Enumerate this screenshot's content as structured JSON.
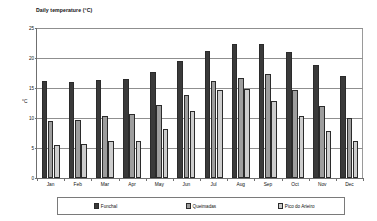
{
  "chart_data": {
    "type": "bar",
    "title": "Daily temperature  (°C)",
    "xlabel": "",
    "ylabel": "°C",
    "ylim": [
      0,
      25
    ],
    "yticks": [
      0,
      5,
      10,
      15,
      20,
      25
    ],
    "ytick_labels": [
      "0",
      "5",
      "10",
      "15",
      "20",
      "25"
    ],
    "grid": true,
    "legend_position": "bottom",
    "categories": [
      "Jan",
      "Feb",
      "Mar",
      "Apr",
      "May",
      "Jun",
      "Jul",
      "Aug",
      "Sep",
      "Oct",
      "Nov",
      "Dec"
    ],
    "series": [
      {
        "name": "Funchal",
        "color": "#3a3a3a",
        "values": [
          16.1,
          16.0,
          16.3,
          16.5,
          17.7,
          19.5,
          21.1,
          22.3,
          22.3,
          21.0,
          18.9,
          17.0
        ]
      },
      {
        "name": "Queimadas",
        "color": "#9d9d9d",
        "values": [
          9.5,
          9.6,
          10.4,
          10.6,
          12.2,
          13.9,
          16.1,
          16.6,
          17.3,
          14.6,
          12.0,
          10.0
        ]
      },
      {
        "name": "Pico do Arieiro",
        "color": "#cdcdcd",
        "values": [
          5.5,
          5.6,
          6.2,
          6.1,
          8.2,
          11.1,
          14.7,
          14.9,
          12.9,
          10.4,
          7.8,
          6.1
        ]
      }
    ]
  }
}
